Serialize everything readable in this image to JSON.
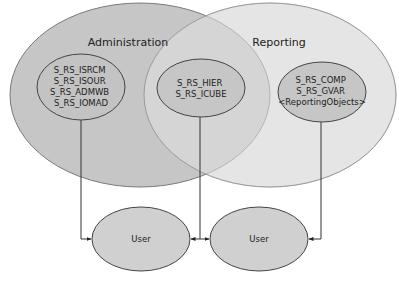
{
  "diagram": {
    "groups": {
      "administration": {
        "label": "Administration",
        "fill": "#c4c4c4"
      },
      "reporting": {
        "label": "Reporting",
        "fill": "#e6e6e6"
      }
    },
    "roles": {
      "admin_only": {
        "lines": [
          "S_RS_ISRCM",
          "S_RS_ISOUR",
          "S_RS_ADMWB",
          "S_RS_IOMAD"
        ]
      },
      "shared": {
        "lines": [
          "S_RS_HIER",
          "S_RS_ICUBE"
        ]
      },
      "reporting_only": {
        "lines": [
          "S_RS_COMP",
          "S_RS_GVAR",
          "<ReportingObjects>"
        ]
      }
    },
    "users": [
      {
        "label": "User"
      },
      {
        "label": "User"
      }
    ],
    "colors": {
      "stroke": "#555555",
      "inner_fill": "#c8c8c8",
      "user_fill": "#cfcfcf"
    }
  }
}
